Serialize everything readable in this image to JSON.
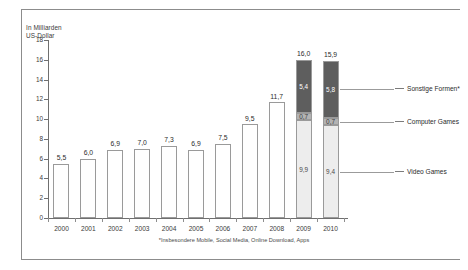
{
  "axis_title": "In Milliarden\nUS-Dollar",
  "footnote": "*Insbesondere Mobile, Social Media, Online Download, Apps",
  "legend": {
    "other": "Sonstige Formen*",
    "computer": "Computer Games",
    "video": "Video Games"
  },
  "colors": {
    "other": "#5e5e5e",
    "computer": "#b3b3b3",
    "video": "#ededed",
    "bar_outline": "#9a9a9a",
    "axis": "#6f6f6f",
    "rule": "#8c8c8c"
  },
  "chart_data": {
    "type": "bar",
    "title": "",
    "subtitle": "",
    "xlabel": "",
    "ylabel": "In Milliarden US-Dollar",
    "ylim": [
      0,
      18
    ],
    "yticks": [
      "0",
      "2",
      "4",
      "6",
      "8",
      "10",
      "12",
      "14",
      "16",
      "18"
    ],
    "ytick_values": [
      0,
      2,
      4,
      6,
      8,
      10,
      12,
      14,
      16,
      18
    ],
    "grid": false,
    "legend_position": "right",
    "categories": [
      "2000",
      "2001",
      "2002",
      "2003",
      "2004",
      "2005",
      "2006",
      "2007",
      "2008",
      "2009",
      "2010"
    ],
    "totals": [
      5.5,
      6.0,
      6.9,
      7.0,
      7.3,
      6.9,
      7.5,
      9.5,
      11.7,
      16.0,
      15.9
    ],
    "total_labels": [
      "5,5",
      "6,0",
      "6,9",
      "7,0",
      "7,3",
      "6,9",
      "7,5",
      "9,5",
      "11,7",
      "16,0",
      "15,9"
    ],
    "stacked_from": "2009",
    "series": [
      {
        "name": "Video Games",
        "values": [
          null,
          null,
          null,
          null,
          null,
          null,
          null,
          null,
          null,
          9.9,
          9.4
        ],
        "labels": [
          null,
          null,
          null,
          null,
          null,
          null,
          null,
          null,
          null,
          "9,9",
          "9,4"
        ]
      },
      {
        "name": "Computer Games",
        "values": [
          null,
          null,
          null,
          null,
          null,
          null,
          null,
          null,
          null,
          0.7,
          0.7
        ],
        "labels": [
          null,
          null,
          null,
          null,
          null,
          null,
          null,
          null,
          null,
          "0,7",
          "0,7"
        ]
      },
      {
        "name": "Sonstige Formen*",
        "values": [
          null,
          null,
          null,
          null,
          null,
          null,
          null,
          null,
          null,
          5.4,
          5.8
        ],
        "labels": [
          null,
          null,
          null,
          null,
          null,
          null,
          null,
          null,
          null,
          "5,4",
          "5,8"
        ]
      }
    ]
  }
}
